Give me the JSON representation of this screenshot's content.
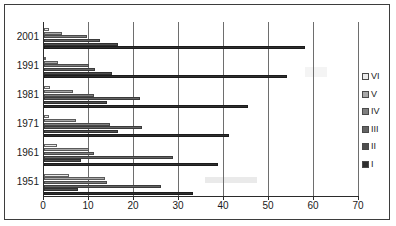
{
  "chart_data": {
    "type": "bar",
    "orientation": "horizontal",
    "title": "",
    "xlabel": "",
    "ylabel": "",
    "categories": [
      "2001",
      "1991",
      "1981",
      "1971",
      "1961",
      "1951"
    ],
    "series": [
      {
        "name": "VI",
        "color": "#ebebeb",
        "values": [
          1.0,
          0.5,
          1.3,
          1.0,
          2.8,
          5.5
        ]
      },
      {
        "name": "V",
        "color": "#a8a8a8",
        "values": [
          4.0,
          3.0,
          6.5,
          7.0,
          10.0,
          13.5
        ]
      },
      {
        "name": "IV",
        "color": "#7f7f7f",
        "values": [
          9.5,
          10.0,
          11.0,
          14.6,
          11.0,
          14.0
        ]
      },
      {
        "name": "III",
        "color": "#646464",
        "values": [
          12.4,
          11.3,
          21.3,
          21.7,
          28.7,
          26.0
        ]
      },
      {
        "name": "II",
        "color": "#4e4e4e",
        "values": [
          16.5,
          15.0,
          14.0,
          16.5,
          8.3,
          7.5
        ]
      },
      {
        "name": "I",
        "color": "#2e2e2e",
        "values": [
          58.0,
          54.0,
          45.4,
          41.0,
          38.7,
          33.0
        ]
      }
    ],
    "xticks": [
      0,
      10,
      20,
      30,
      40,
      50,
      60,
      70
    ],
    "xlim": [
      0,
      70
    ],
    "grid": true,
    "legend_position": "right",
    "legend_order": [
      "VI",
      "V",
      "IV",
      "III",
      "II",
      "I"
    ]
  },
  "axis": {
    "x_tick_labels": [
      "0",
      "10",
      "20",
      "30",
      "40",
      "50",
      "60",
      "70"
    ],
    "y_tick_labels": [
      "2001",
      "1991",
      "1981",
      "1971",
      "1961",
      "1951"
    ]
  },
  "legend": {
    "items": [
      {
        "label": "VI"
      },
      {
        "label": "V"
      },
      {
        "label": "IV"
      },
      {
        "label": "III"
      },
      {
        "label": "II"
      },
      {
        "label": "I"
      }
    ]
  }
}
